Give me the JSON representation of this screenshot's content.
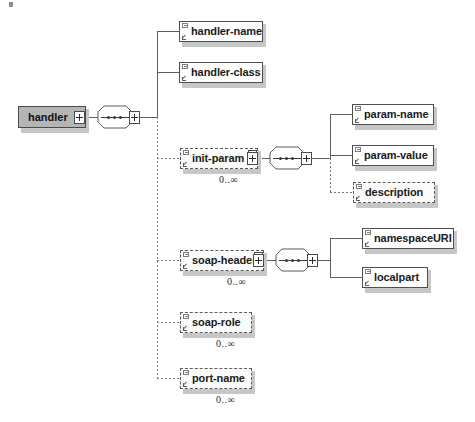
{
  "diagram": {
    "type": "xml-schema-tree",
    "root": {
      "name": "handler",
      "expander": "+"
    },
    "compositors": [
      {
        "id": "seq-root",
        "symbol": "sequence"
      },
      {
        "id": "seq-init-param",
        "symbol": "sequence"
      },
      {
        "id": "seq-soap-header",
        "symbol": "sequence"
      }
    ],
    "nodes": [
      {
        "id": "handler-name",
        "label": "handler-name",
        "optional": false,
        "cardinality": "",
        "expander": false
      },
      {
        "id": "handler-class",
        "label": "handler-class",
        "optional": false,
        "cardinality": "",
        "expander": false
      },
      {
        "id": "init-param",
        "label": "init-param",
        "optional": true,
        "cardinality": "0..∞",
        "expander": true
      },
      {
        "id": "param-name",
        "label": "param-name",
        "optional": false,
        "cardinality": "",
        "expander": false
      },
      {
        "id": "param-value",
        "label": "param-value",
        "optional": false,
        "cardinality": "",
        "expander": false
      },
      {
        "id": "description",
        "label": "description",
        "optional": true,
        "cardinality": "",
        "expander": false
      },
      {
        "id": "soap-header",
        "label": "soap-header",
        "optional": true,
        "cardinality": "0..∞",
        "expander": true
      },
      {
        "id": "namespaceURI",
        "label": "namespaceURI",
        "optional": false,
        "cardinality": "",
        "expander": false
      },
      {
        "id": "localpart",
        "label": "localpart",
        "optional": false,
        "cardinality": "",
        "expander": false
      },
      {
        "id": "soap-role",
        "label": "soap-role",
        "optional": true,
        "cardinality": "0..∞",
        "expander": false
      },
      {
        "id": "port-name",
        "label": "port-name",
        "optional": true,
        "cardinality": "0..∞",
        "expander": false
      }
    ],
    "colors": {
      "background": "#ffffff",
      "root_fill": "#b5b5b5",
      "node_fill": "#ffffff",
      "stroke": "#4f4f4f",
      "optional_stroke": "#5a5a5a",
      "shadow": "#c7c7c7",
      "text": "#1a1a1a"
    }
  }
}
